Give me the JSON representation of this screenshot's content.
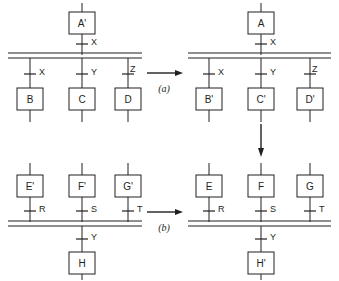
{
  "figure": {
    "title": "",
    "background_color": "#ffffff",
    "line_color": "#231f20",
    "width": 339,
    "height": 281
  },
  "steps": [
    {
      "id": "a",
      "label": "(a)",
      "direction": "horizontal",
      "from": "panel-top-left",
      "to": "panel-top-right"
    },
    {
      "id": "b",
      "label": "(b)",
      "direction": "horizontal",
      "from": "panel-bottom-left",
      "to": "panel-bottom-right"
    },
    {
      "id": "vertical",
      "label": "",
      "direction": "vertical",
      "from": "panel-top-right",
      "to": "panel-bottom-right"
    }
  ],
  "panels": [
    {
      "id": "panel-top-left",
      "position": "top-left",
      "bus_orientation": "horizontal",
      "top_modules": [
        {
          "name": "A'",
          "signal": "X",
          "side": "above"
        }
      ],
      "bottom_modules": [
        {
          "name": "B",
          "signal": "X",
          "side": "below"
        },
        {
          "name": "C",
          "signal": "Y",
          "side": "below"
        },
        {
          "name": "D",
          "signal": "Z",
          "side": "below"
        }
      ]
    },
    {
      "id": "panel-top-right",
      "position": "top-right",
      "bus_orientation": "horizontal",
      "top_modules": [
        {
          "name": "A",
          "signal": "X",
          "side": "above"
        }
      ],
      "bottom_modules": [
        {
          "name": "B'",
          "signal": "X",
          "side": "below"
        },
        {
          "name": "C'",
          "signal": "Y",
          "side": "below"
        },
        {
          "name": "D'",
          "signal": "Z",
          "side": "below"
        }
      ]
    },
    {
      "id": "panel-bottom-left",
      "position": "bottom-left",
      "bus_orientation": "horizontal",
      "top_modules": [
        {
          "name": "E'",
          "signal": "R",
          "side": "above"
        },
        {
          "name": "F'",
          "signal": "S",
          "side": "above"
        },
        {
          "name": "G'",
          "signal": "T",
          "side": "above"
        }
      ],
      "bottom_modules": [
        {
          "name": "H",
          "signal": "Y",
          "side": "below"
        }
      ]
    },
    {
      "id": "panel-bottom-right",
      "position": "bottom-right",
      "bus_orientation": "horizontal",
      "top_modules": [
        {
          "name": "E",
          "signal": "R",
          "side": "above"
        },
        {
          "name": "F",
          "signal": "S",
          "side": "above"
        },
        {
          "name": "G",
          "signal": "T",
          "side": "above"
        }
      ],
      "bottom_modules": [
        {
          "name": "H'",
          "signal": "Y",
          "side": "below"
        }
      ]
    }
  ]
}
